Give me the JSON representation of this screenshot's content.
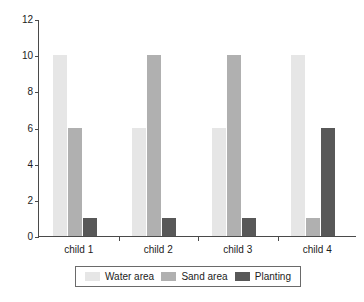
{
  "chart_data": {
    "type": "bar",
    "title": "",
    "subtitle": "",
    "xlabel": "",
    "ylabel": "",
    "categories": [
      "child 1",
      "child 2",
      "child 3",
      "child 4"
    ],
    "series": [
      {
        "name": "Water area",
        "color": "#e6e6e6",
        "values": [
          10,
          6,
          6,
          10
        ]
      },
      {
        "name": "Sand area",
        "color": "#b0b0b0",
        "values": [
          6,
          10,
          10,
          1
        ]
      },
      {
        "name": "Planting",
        "color": "#585858",
        "values": [
          1,
          1,
          1,
          6
        ]
      }
    ],
    "ylim": [
      0,
      12
    ],
    "yticks": [
      0,
      2,
      4,
      6,
      8,
      10,
      12
    ],
    "ytick_labels": [
      "0",
      "2",
      "4",
      "6",
      "8",
      "10",
      "12"
    ],
    "grid": false,
    "legend_position": "bottom",
    "axis_color": "#4a4a4a",
    "background": "#ffffff"
  }
}
